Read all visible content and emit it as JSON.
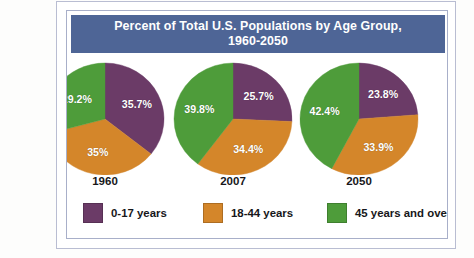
{
  "figure": {
    "title_line1": "Percent of Total U.S. Populations by Age Group,",
    "title_line2": "1960-2050",
    "banner_color": "#4e6596",
    "frame_color": "#a8afc9",
    "background": "#ffffff"
  },
  "legend": {
    "items": [
      {
        "label": "0-17 years",
        "color": "#6b3b67"
      },
      {
        "label": "18-44 years",
        "color": "#d4862a"
      },
      {
        "label": "45 years and over",
        "color": "#4e9c3a"
      }
    ]
  },
  "chart_data": {
    "type": "pie",
    "title": "Percent of Total U.S. Populations by Age Group, 1960-2050",
    "xlabel": "",
    "ylabel": "",
    "legend_position": "bottom",
    "grid": false,
    "units": "percent",
    "categories": [
      "0-17 years",
      "18-44 years",
      "45 years and over"
    ],
    "colors": [
      "#6b3b67",
      "#d4862a",
      "#4e9c3a"
    ],
    "panels": [
      {
        "name": "1960",
        "year_label": "1960",
        "values": [
          35.7,
          35.0,
          29.2
        ],
        "labels": [
          "35.7%",
          "35%",
          "29.2%"
        ]
      },
      {
        "name": "2007",
        "year_label": "2007",
        "values": [
          25.7,
          34.4,
          39.8
        ],
        "labels": [
          "25.7%",
          "34.4%",
          "39.8%"
        ]
      },
      {
        "name": "2050",
        "year_label": "2050",
        "values": [
          23.8,
          33.9,
          42.4
        ],
        "labels": [
          "23.8%",
          "33.9%",
          "42.4%"
        ]
      }
    ]
  }
}
